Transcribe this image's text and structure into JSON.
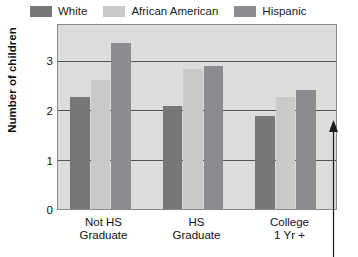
{
  "chart_data": {
    "type": "bar",
    "title": "",
    "xlabel": "",
    "ylabel": "Number of children",
    "categories": [
      "Not HS Graduate",
      "HS Graduate",
      "College 1 Yr +"
    ],
    "category_lines": [
      [
        "Not HS",
        "Graduate"
      ],
      [
        "HS",
        "Graduate"
      ],
      [
        "College",
        "1 Yr +"
      ]
    ],
    "series": [
      {
        "name": "White",
        "color": "#77777a",
        "values": [
          2.27,
          2.09,
          1.89
        ]
      },
      {
        "name": "African American",
        "color": "#c9c9cb",
        "values": [
          2.61,
          2.84,
          2.27
        ]
      },
      {
        "name": "Hispanic",
        "color": "#8c8c90",
        "values": [
          3.36,
          2.9,
          2.4
        ]
      }
    ],
    "ylim": [
      0,
      3.72
    ],
    "yticks": [
      0,
      1,
      2,
      3
    ],
    "ytick_labels": [
      "0",
      "1",
      "2",
      "3"
    ],
    "grid": true,
    "gridline_color": "#555555",
    "legend_position": "top-left",
    "plot_background": "#dcdcdc",
    "plot_border_color": "#8a8a8a",
    "annotations": [
      {
        "name": "upward-arrow",
        "type": "arrow",
        "direction": "up",
        "text": ""
      }
    ]
  },
  "legend": {
    "entries": [
      {
        "label": "White",
        "color": "#77777a"
      },
      {
        "label": "African American",
        "color": "#c9c9cb"
      },
      {
        "label": "Hispanic",
        "color": "#8c8c90"
      }
    ]
  },
  "axes": {
    "y_title": "Number of children",
    "y_ticks": [
      "3",
      "2",
      "1",
      "0"
    ],
    "x_categories": [
      {
        "line1": "Not HS",
        "line2": "Graduate"
      },
      {
        "line1": "HS",
        "line2": "Graduate"
      },
      {
        "line1": "College",
        "line2": "1 Yr +"
      }
    ]
  }
}
